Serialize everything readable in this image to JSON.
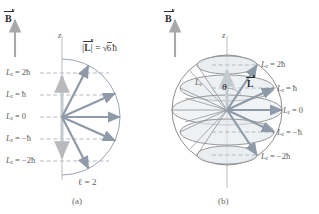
{
  "figure": {
    "title_concept": "Space quantization of orbital angular momentum for l = 2",
    "panels": [
      {
        "id": "a",
        "caption": "(a)",
        "field_label": "B",
        "axis_label": "z",
        "magnitude_label_L": "L",
        "magnitude_label_eq": "=",
        "magnitude_label_value": "6",
        "magnitude_label_hbar": "ħ",
        "quantum_number_label": "ℓ = 2",
        "lz_labels": [
          {
            "lead": "L",
            "sub": "z",
            "value": "= 2ħ"
          },
          {
            "lead": "L",
            "sub": "z",
            "value": "= ħ"
          },
          {
            "lead": "L",
            "sub": "z",
            "value": "= 0"
          },
          {
            "lead": "L",
            "sub": "z",
            "value": "= −ħ"
          },
          {
            "lead": "L",
            "sub": "z",
            "value": "= −2ħ"
          }
        ]
      },
      {
        "id": "b",
        "caption": "(b)",
        "field_label": "B",
        "axis_label": "z",
        "lz_component_label": "L",
        "lz_component_sub": "z",
        "angle_label": "θ",
        "vector_label": "L",
        "lz_labels": [
          {
            "lead": "L",
            "sub": "z",
            "value": "= 2ħ"
          },
          {
            "lead": "L",
            "sub": "z",
            "value": "= ħ"
          },
          {
            "lead": "L",
            "sub": "z",
            "value": "= 0"
          },
          {
            "lead": "L",
            "sub": "z",
            "value": "= −ħ"
          },
          {
            "lead": "L",
            "sub": "z",
            "value": "= −2ħ"
          }
        ]
      }
    ],
    "colors": {
      "vector": "#8e9aa8",
      "axis": "#b9b9bb",
      "arc": "#9aa5b0",
      "dashed": "#a9b2bc",
      "text": "#5f5f62",
      "bold_text": "#2b2b2e",
      "sphere_line": "#8d8d90",
      "cone_fill": "#dfe4e8",
      "background": "#ffffff"
    },
    "geometry": {
      "quantum_states": [
        2,
        1,
        0,
        -1,
        -2
      ],
      "l_value": 2,
      "magnitude_hbar": 2.449
    }
  }
}
